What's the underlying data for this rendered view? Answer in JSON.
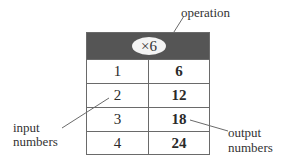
{
  "diagram": {
    "operation": "×6",
    "rows": [
      {
        "input": "1",
        "output": "6"
      },
      {
        "input": "2",
        "output": "12"
      },
      {
        "input": "3",
        "output": "18"
      },
      {
        "input": "4",
        "output": "24"
      }
    ],
    "labels": {
      "operation": "operation",
      "input_line1": "input",
      "input_line2": "numbers",
      "output_line1": "output",
      "output_line2": "numbers"
    }
  }
}
